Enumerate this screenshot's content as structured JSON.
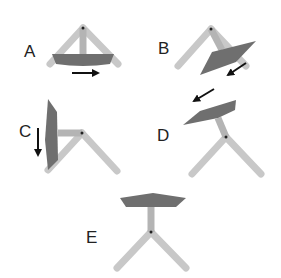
{
  "diagram": {
    "panels": [
      {
        "id": "A",
        "label": "A",
        "arrow_direction": "right"
      },
      {
        "id": "B",
        "label": "B",
        "arrow_direction": "down-left"
      },
      {
        "id": "C",
        "label": "C",
        "arrow_direction": "down"
      },
      {
        "id": "D",
        "label": "D",
        "arrow_direction": "down-left"
      },
      {
        "id": "E",
        "label": "E",
        "arrow_direction": "none"
      }
    ],
    "colors": {
      "arm": "#c8c8c8",
      "stem": "#b4b4b4",
      "plate": "#6f6f6f",
      "arrow": "#111111",
      "pivot": "#222222",
      "background": "#ffffff"
    }
  }
}
